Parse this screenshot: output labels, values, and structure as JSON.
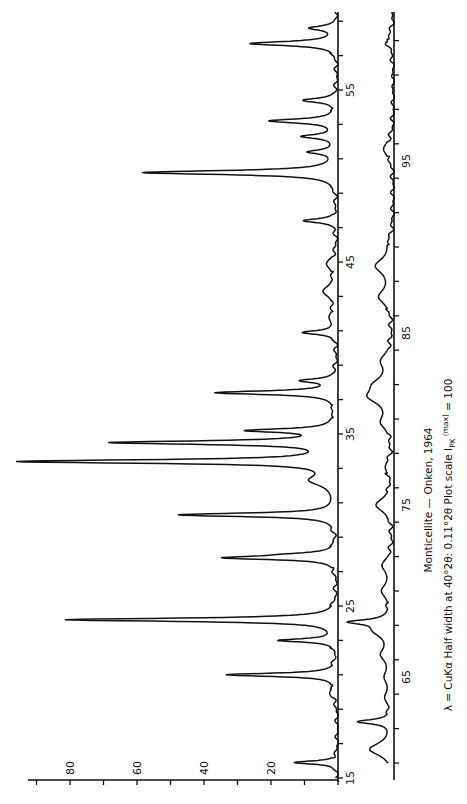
{
  "title": "Monticellite — Onken, 1964",
  "caption": {
    "line1": "Monticellite — Onken, 1964",
    "line2_prefix": "λ = CuKα   Half width at 40°2θ: 0.11°2θ    Plot scale I",
    "line2_sub": "PK",
    "line2_sup": "(max)",
    "line2_suffix": " = 100"
  },
  "axes": {
    "intensity_ticks": [
      "20",
      "40",
      "60",
      "80"
    ],
    "upper_two_theta_ticks": [
      "15",
      "25",
      "35",
      "45",
      "55"
    ],
    "lower_two_theta_ticks": [
      "65",
      "75",
      "85",
      "95"
    ]
  },
  "chart_data": {
    "type": "line",
    "title": "Monticellite — Onken, 1964",
    "subtitle": "λ = CuKα  Half width at 40°2θ: 0.11°2θ  Plot scale I_PK (max) = 100",
    "xlabel": "2θ (degrees)",
    "ylabel": "Intensity (I_PK)",
    "orientation": "rotated 90° counter-clockwise (2θ increases upward, intensity increases leftward)",
    "grid": false,
    "legend": null,
    "series": [
      {
        "name": "Upper strip (15–60° 2θ)",
        "xlim": [
          15,
          60
        ],
        "ylim": [
          0,
          100
        ],
        "x_ticks": [
          15,
          25,
          35,
          45,
          55
        ],
        "y_ticks": [
          20,
          40,
          60,
          80
        ],
        "peaks": [
          {
            "two_theta": 15.9,
            "intensity": 13
          },
          {
            "two_theta": 19.9,
            "intensity": 2
          },
          {
            "two_theta": 21.0,
            "intensity": 33
          },
          {
            "two_theta": 23.0,
            "intensity": 17
          },
          {
            "two_theta": 24.2,
            "intensity": 81
          },
          {
            "two_theta": 27.8,
            "intensity": 32
          },
          {
            "two_theta": 28.0,
            "intensity": 9
          },
          {
            "two_theta": 30.3,
            "intensity": 47
          },
          {
            "two_theta": 32.3,
            "intensity": 7
          },
          {
            "two_theta": 33.4,
            "intensity": 94
          },
          {
            "two_theta": 34.5,
            "intensity": 66
          },
          {
            "two_theta": 35.2,
            "intensity": 25
          },
          {
            "two_theta": 37.4,
            "intensity": 36
          },
          {
            "two_theta": 38.1,
            "intensity": 10
          },
          {
            "two_theta": 40.9,
            "intensity": 10
          },
          {
            "two_theta": 41.8,
            "intensity": 2
          },
          {
            "two_theta": 43.3,
            "intensity": 4
          },
          {
            "two_theta": 44.9,
            "intensity": 3
          },
          {
            "two_theta": 47.4,
            "intensity": 10
          },
          {
            "two_theta": 50.2,
            "intensity": 58
          },
          {
            "two_theta": 51.4,
            "intensity": 8
          },
          {
            "two_theta": 52.3,
            "intensity": 10
          },
          {
            "two_theta": 53.2,
            "intensity": 20
          },
          {
            "two_theta": 54.4,
            "intensity": 10
          },
          {
            "two_theta": 57.7,
            "intensity": 26
          },
          {
            "two_theta": 58.6,
            "intensity": 8
          }
        ]
      },
      {
        "name": "Lower strip (60–104° 2θ)",
        "xlim": [
          60,
          104
        ],
        "ylim": [
          0,
          100
        ],
        "x_ticks": [
          65,
          75,
          85,
          95
        ],
        "peaks": [
          {
            "two_theta": 60.8,
            "intensity": 7
          },
          {
            "two_theta": 62.4,
            "intensity": 10
          },
          {
            "two_theta": 63.8,
            "intensity": 2
          },
          {
            "two_theta": 65.0,
            "intensity": 2
          },
          {
            "two_theta": 66.3,
            "intensity": 3
          },
          {
            "two_theta": 67.7,
            "intensity": 5
          },
          {
            "two_theta": 68.2,
            "intensity": 11
          },
          {
            "two_theta": 70.0,
            "intensity": 3
          },
          {
            "two_theta": 71.5,
            "intensity": 3
          },
          {
            "two_theta": 75.0,
            "intensity": 5
          },
          {
            "two_theta": 77.2,
            "intensity": 2
          },
          {
            "two_theta": 79.8,
            "intensity": 3
          },
          {
            "two_theta": 81.3,
            "intensity": 6
          },
          {
            "two_theta": 82.0,
            "intensity": 4
          },
          {
            "two_theta": 83.4,
            "intensity": 3
          },
          {
            "two_theta": 87.1,
            "intensity": 4
          },
          {
            "two_theta": 88.9,
            "intensity": 5
          },
          {
            "two_theta": 90.2,
            "intensity": 1
          },
          {
            "two_theta": 95.7,
            "intensity": 3
          },
          {
            "two_theta": 102.0,
            "intensity": 2
          }
        ]
      }
    ]
  }
}
